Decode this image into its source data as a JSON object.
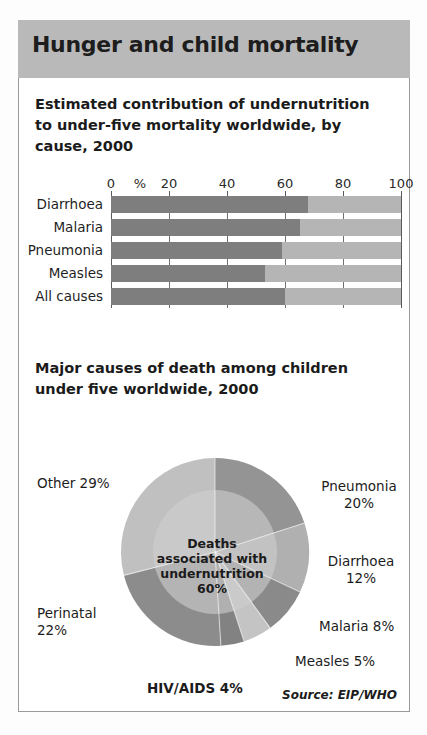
{
  "header": {
    "title": "Hunger and child mortality"
  },
  "chart_data": [
    {
      "type": "bar",
      "orientation": "horizontal",
      "stacked": true,
      "title": "Estimated contribution of undernutrition to under-five mortality worldwide, by cause, 2000",
      "xlabel": "%",
      "ylabel": "",
      "xlim": [
        0,
        100
      ],
      "ticks": [
        "0",
        "%",
        "20",
        "40",
        "60",
        "80",
        "100"
      ],
      "tick_values": [
        0,
        10,
        20,
        40,
        60,
        80,
        100
      ],
      "grid": true,
      "categories": [
        "Diarrhoea",
        "Malaria",
        "Pneumonia",
        "Measles",
        "All causes"
      ],
      "series": [
        {
          "name": "Associated with undernutrition",
          "color": "#7e7e7e",
          "values": [
            68,
            65,
            59,
            53,
            60
          ]
        },
        {
          "name": "Other",
          "color": "#b5b5b5",
          "values": [
            32,
            35,
            41,
            47,
            40
          ]
        }
      ]
    },
    {
      "type": "pie",
      "title": "Major causes of death among children under five worldwide, 2000",
      "center_label": "Deaths associated with undernutrition 60%",
      "center_label_lines": [
        "Deaths",
        "associated with",
        "undernutrition",
        "60%"
      ],
      "labels": [
        "Pneumonia",
        "Diarrhoea",
        "Malaria",
        "Measles",
        "HIV/AIDS",
        "Perinatal",
        "Other"
      ],
      "values": [
        20,
        12,
        8,
        5,
        4,
        22,
        29
      ],
      "label_text": [
        "Pneumonia 20%",
        "Diarrhoea 12%",
        "Malaria 8%",
        "Measles 5%",
        "HIV/AIDS 4%",
        "Perinatal 22%",
        "Other 29%"
      ],
      "colors": [
        "#949494",
        "#b0b0b0",
        "#8a8a8a",
        "#c4c4c4",
        "#828282",
        "#8c8c8c",
        "#c0c0c0"
      ],
      "source": "Source: EIP/WHO"
    }
  ],
  "bar_chart_labels": {
    "title_lines": [
      "Estimated contribution of undernutrition",
      "to under-five mortality worldwide, by",
      "cause, 2000"
    ]
  },
  "pie_chart_labels": {
    "title_lines": [
      "Major causes of death among children",
      "under five worldwide, 2000"
    ],
    "pneumonia_l1": "Pneumonia",
    "pneumonia_l2": "20%",
    "diarrhoea_l1": "Diarrhoea",
    "diarrhoea_l2": "12%",
    "malaria": "Malaria 8%",
    "measles": "Measles 5%",
    "hivaids": "HIV/AIDS 4%",
    "perinatal_l1": "Perinatal",
    "perinatal_l2": "22%",
    "other": "Other 29%",
    "center_l1": "Deaths",
    "center_l2": "associated with",
    "center_l3": "undernutrition",
    "center_l4": "60%",
    "source": "Source: EIP/WHO"
  },
  "colors": {
    "header_band": "#b9b9b9",
    "bar_dark": "#7e7e7e",
    "bar_light": "#b5b5b5",
    "text": "#1b1b1b",
    "border": "#9a9a9a"
  }
}
